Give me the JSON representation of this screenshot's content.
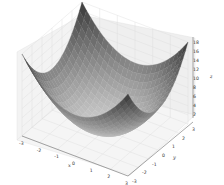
{
  "chart_data": {
    "type": "surface3d",
    "title": "",
    "function": "z = x^2 + y^2",
    "xlabel": "x",
    "ylabel": "y",
    "zlabel": "z",
    "xlim": [
      -3,
      3
    ],
    "ylim": [
      -3,
      3
    ],
    "zlim": [
      0,
      18
    ],
    "x_ticks": [
      "-3",
      "-2",
      "-1",
      "0",
      "1",
      "2",
      "3"
    ],
    "y_ticks": [
      "-3",
      "-2",
      "-1",
      "0",
      "1",
      "2",
      "3"
    ],
    "z_ticks": [
      "2",
      "4",
      "6",
      "8",
      "10",
      "12",
      "14",
      "16",
      "18"
    ],
    "grid": true,
    "colormap": "grayscale",
    "colors": {
      "pane": "#f2f2f2",
      "grid": "#d8d8d8",
      "surface_low": "#c8c8c8",
      "surface_high": "#3a3a3a"
    }
  }
}
